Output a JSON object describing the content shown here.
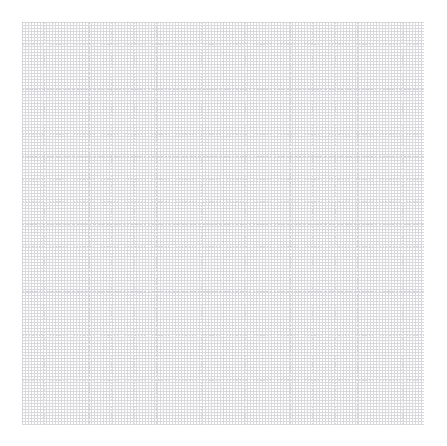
{
  "canvas": {
    "width": 447,
    "height": 446,
    "background_color": "#ffffff",
    "content_description": "empty grid canvas",
    "has_text": false,
    "has_data_marks": false
  },
  "grid": {
    "name": "graph-paper-grid",
    "origin_x": 22,
    "origin_y": 22,
    "end_x": 424,
    "end_y": 425,
    "width": 402,
    "height": 403,
    "columns": 18,
    "rows": 18,
    "cell_width": 22.33,
    "cell_height": 22.39,
    "line_style": "dotted",
    "minor_line_color": "#dcdcdf",
    "major_line_color": "#d2d2d6",
    "major_every_n_cells": 3,
    "line_width": 1
  }
}
